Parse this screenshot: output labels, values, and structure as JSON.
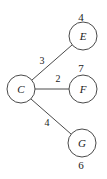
{
  "diagram": {
    "type": "weighted-graph",
    "nodes": [
      {
        "id": "C",
        "label": "C",
        "value": "",
        "cx": 21,
        "cy": 89,
        "r": 14,
        "value_pos": "none"
      },
      {
        "id": "E",
        "label": "E",
        "value": "4",
        "cx": 83,
        "cy": 36,
        "r": 14,
        "value_pos": "above"
      },
      {
        "id": "F",
        "label": "F",
        "value": "7",
        "cx": 83,
        "cy": 89,
        "r": 14,
        "value_pos": "above"
      },
      {
        "id": "G",
        "label": "G",
        "value": "6",
        "cx": 82,
        "cy": 143,
        "r": 14,
        "value_pos": "below"
      }
    ],
    "edges": [
      {
        "from": "C",
        "to": "E",
        "weight": "3",
        "label_x": 42,
        "label_y": 60
      },
      {
        "from": "C",
        "to": "F",
        "weight": "2",
        "label_x": 58,
        "label_y": 78
      },
      {
        "from": "C",
        "to": "G",
        "weight": "4",
        "label_x": 47,
        "label_y": 122
      }
    ]
  },
  "colors": {
    "stroke": "#4a4a4a",
    "text": "#1a1a1a",
    "background": "#ffffff"
  }
}
